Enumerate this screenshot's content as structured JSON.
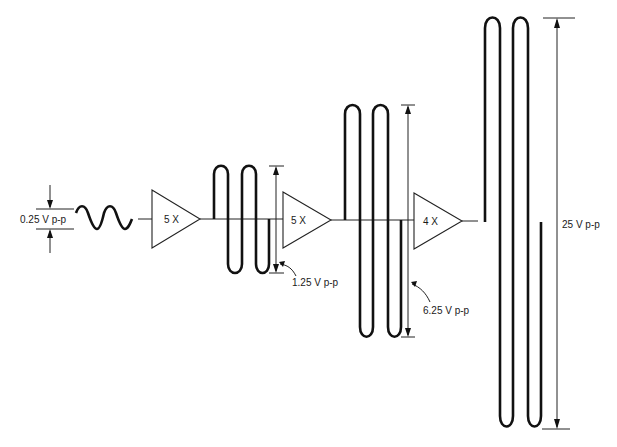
{
  "diagram": {
    "title": "",
    "type": "cascaded amplifier gain stages",
    "input": {
      "label": "0.25 V p-p",
      "cycles": 2
    },
    "stages": [
      {
        "gain_label": "5 X",
        "output_label": "1.25 V p-p"
      },
      {
        "gain_label": "5 X",
        "output_label": "6.25 V p-p"
      },
      {
        "gain_label": "4 X",
        "output_label": "25 V p-p"
      }
    ],
    "colors": {
      "line": "#111111",
      "background": "#ffffff"
    }
  }
}
